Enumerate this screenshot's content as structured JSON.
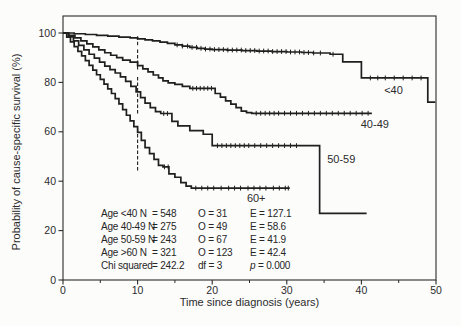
{
  "figure": {
    "background": "#fcfcfb",
    "ink": "#2b2b2b",
    "curve_color": "#1f1f1f"
  },
  "chart_data": {
    "type": "line",
    "subtype": "kaplan-meier-step",
    "title": "",
    "xlabel": "Time since diagnosis (years)",
    "ylabel": "Probability of cause-specific survival (%)",
    "xlim": [
      0,
      50
    ],
    "ylim": [
      0,
      100
    ],
    "x_major_ticks": [
      0,
      10,
      20,
      30,
      40,
      50
    ],
    "x_minor_ticks": [
      5,
      15,
      25,
      35,
      45
    ],
    "y_major_ticks": [
      0,
      20,
      40,
      60,
      80,
      100
    ],
    "grid": false,
    "legend_position": "inline-labels",
    "ci_bar_x": 10,
    "series": [
      {
        "id": "under-40",
        "name": "<40",
        "label_pos": [
          44.3,
          77
        ],
        "ci_10y": [
          95,
          99.3
        ],
        "points": [
          [
            0,
            100
          ],
          [
            1.5,
            99.7
          ],
          [
            3,
            99.4
          ],
          [
            4.5,
            99
          ],
          [
            6,
            98.7
          ],
          [
            7.5,
            98.3
          ],
          [
            9,
            98
          ],
          [
            10,
            97.6
          ],
          [
            11,
            97.2
          ],
          [
            12,
            96.8
          ],
          [
            13,
            96.3
          ],
          [
            14,
            95.8
          ],
          [
            15,
            95.2
          ],
          [
            16,
            94.7
          ],
          [
            17,
            94.2
          ],
          [
            18,
            93.8
          ],
          [
            19,
            93.5
          ],
          [
            20,
            93.3
          ],
          [
            22,
            93.1
          ],
          [
            24,
            92.9
          ],
          [
            26,
            92.7
          ],
          [
            28,
            92.5
          ],
          [
            30,
            92.3
          ],
          [
            32,
            92.1
          ],
          [
            33.5,
            91.9
          ],
          [
            35.8,
            91.4
          ],
          [
            37.5,
            88.3
          ],
          [
            40,
            81.8
          ],
          [
            48.9,
            72
          ],
          [
            49.9,
            72
          ]
        ],
        "censor_ticks": [
          15.3,
          16,
          16.7,
          17.3,
          17.9,
          18.5,
          19.1,
          19.7,
          20.3,
          20.9,
          21.5,
          22.1,
          22.7,
          23.3,
          23.9,
          24.5,
          25.1,
          25.7,
          26.3,
          26.9,
          27.5,
          28.1,
          28.7,
          29.3,
          29.9,
          30.5,
          31.1,
          31.7,
          32.3,
          32.9,
          33.6,
          34.5,
          36.2,
          41.2,
          42.2,
          43.2,
          44.4,
          45.6,
          46.8,
          48
        ]
      },
      {
        "id": "40-49",
        "name": "40-49",
        "label_pos": [
          41.8,
          63
        ],
        "ci_10y": [
          85.2,
          93.8
        ],
        "points": [
          [
            0,
            100
          ],
          [
            0.8,
            99
          ],
          [
            1.6,
            98
          ],
          [
            2.4,
            96.8
          ],
          [
            3.2,
            95.6
          ],
          [
            4,
            94.4
          ],
          [
            4.8,
            93.2
          ],
          [
            5.6,
            92
          ],
          [
            6.4,
            91
          ],
          [
            7.2,
            90
          ],
          [
            8,
            89
          ],
          [
            9,
            88.2
          ],
          [
            10,
            86.8
          ],
          [
            10.7,
            85.5
          ],
          [
            11.4,
            84.3
          ],
          [
            12.1,
            83
          ],
          [
            12.8,
            81.8
          ],
          [
            13.4,
            80.6
          ],
          [
            14.1,
            79.8
          ],
          [
            15,
            79.2
          ],
          [
            16,
            78.4
          ],
          [
            17,
            77.6
          ],
          [
            20.4,
            75.5
          ],
          [
            21.1,
            74
          ],
          [
            21.8,
            72.5
          ],
          [
            22.5,
            71.2
          ],
          [
            23.2,
            69.8
          ],
          [
            23.9,
            68.4
          ],
          [
            24.6,
            67.8
          ],
          [
            25.3,
            67.5
          ],
          [
            41.4,
            67.5
          ]
        ],
        "censor_ticks": [
          17.4,
          17.9,
          18.4,
          18.9,
          19.4,
          19.9,
          25.9,
          26.5,
          27.1,
          27.7,
          28.3,
          28.9,
          29.7,
          30.5,
          31.3,
          32.1,
          32.9,
          33.7,
          34.5,
          35.3,
          36.1,
          36.9,
          37.7,
          38.5,
          39.3,
          40.1,
          40.9
        ]
      },
      {
        "id": "50-59",
        "name": "50-59",
        "label_pos": [
          37.3,
          49
        ],
        "ci_10y": [
          67.4,
          82.6
        ],
        "points": [
          [
            0,
            100
          ],
          [
            0.7,
            98.4
          ],
          [
            1.4,
            96.8
          ],
          [
            2.1,
            95
          ],
          [
            2.8,
            93.2
          ],
          [
            3.5,
            91.4
          ],
          [
            4.2,
            89.8
          ],
          [
            4.9,
            88.2
          ],
          [
            5.6,
            86.6
          ],
          [
            6.3,
            85.2
          ],
          [
            7,
            83.8
          ],
          [
            7.7,
            82.2
          ],
          [
            8.4,
            80.4
          ],
          [
            9.1,
            78.4
          ],
          [
            9.8,
            76.2
          ],
          [
            10.4,
            73.8
          ],
          [
            11,
            71.6
          ],
          [
            11.7,
            69.8
          ],
          [
            12.4,
            68.2
          ],
          [
            13.1,
            67.4
          ],
          [
            14.6,
            64.2
          ],
          [
            15.4,
            62.4
          ],
          [
            17,
            60.5
          ],
          [
            18.8,
            59
          ],
          [
            20,
            54.4
          ],
          [
            34.4,
            27
          ],
          [
            40.7,
            27
          ]
        ],
        "censor_ticks": [
          13.5,
          14,
          20.7,
          21.3,
          21.9,
          22.5,
          23.1,
          23.7,
          24.3,
          24.9,
          25.7,
          26.5,
          27.3,
          28.1,
          28.9,
          29.7,
          30.5,
          31.3
        ]
      },
      {
        "id": "60-plus",
        "name": "60+",
        "label_pos": [
          25.9,
          33
        ],
        "ci_10y": [
          44.3,
          61.5
        ],
        "points": [
          [
            0,
            100
          ],
          [
            0.5,
            98.3
          ],
          [
            1,
            96.4
          ],
          [
            1.5,
            94.5
          ],
          [
            2,
            92.6
          ],
          [
            2.5,
            90.7
          ],
          [
            3,
            88.8
          ],
          [
            3.5,
            86.9
          ],
          [
            4,
            85
          ],
          [
            4.5,
            83.1
          ],
          [
            5,
            81.2
          ],
          [
            5.5,
            79.3
          ],
          [
            6,
            77.4
          ],
          [
            6.5,
            75.5
          ],
          [
            7,
            73.4
          ],
          [
            7.5,
            71.3
          ],
          [
            8,
            69
          ],
          [
            8.5,
            66.7
          ],
          [
            9,
            64.4
          ],
          [
            9.5,
            62.1
          ],
          [
            10,
            59.8
          ],
          [
            10.5,
            56.5
          ],
          [
            11,
            53.6
          ],
          [
            11.6,
            51.2
          ],
          [
            12.2,
            48.8
          ],
          [
            12.8,
            46.4
          ],
          [
            13.4,
            45.8
          ],
          [
            14.2,
            43
          ],
          [
            15,
            41.6
          ],
          [
            15.8,
            39.4
          ],
          [
            16.5,
            38
          ],
          [
            17.2,
            37.2
          ],
          [
            30.4,
            37.2
          ]
        ],
        "censor_ticks": [
          13.6,
          14.1,
          17.8,
          18.6,
          19.4,
          20.2,
          21.2,
          22.2,
          23,
          23.8,
          24.8,
          25.6,
          26.4,
          27.2,
          28.2,
          29,
          29.8,
          30.2
        ]
      }
    ]
  },
  "stats": {
    "rows": [
      {
        "c0": "Age <40 N",
        "c1": "= 548",
        "c2": "O = 31",
        "c3": "E = 127.1"
      },
      {
        "c0": "Age 40-49 N",
        "c1": "= 275",
        "c2": "O = 49",
        "c3": "E = 58.6"
      },
      {
        "c0": "Age 50-59 N",
        "c1": "= 243",
        "c2": "O = 67",
        "c3": "E = 41.9"
      },
      {
        "c0": "Age >60 N",
        "c1": "= 321",
        "c2": "O = 123",
        "c3": "E = 42.4"
      },
      {
        "c0": "Chi squared",
        "c1": "= 242.2",
        "c2": "df = 3",
        "c3_italic": "p",
        "c3_rest": "= 0.000"
      }
    ]
  }
}
